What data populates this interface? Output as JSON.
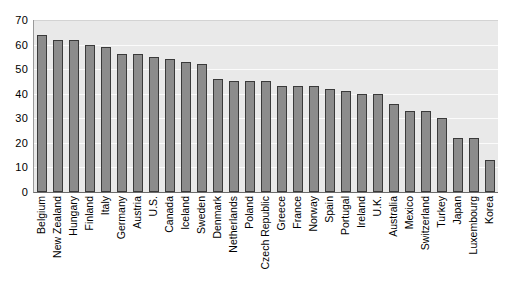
{
  "chart_data": {
    "type": "bar",
    "title": "",
    "subtitle": "",
    "xlabel": "",
    "ylabel": "",
    "ylim": [
      0,
      70
    ],
    "yticks": [
      0,
      10,
      20,
      30,
      40,
      50,
      60,
      70
    ],
    "grid": true,
    "legend": "none",
    "orientation": "vertical",
    "bar_color": "#8c8c8c",
    "bar_edge_color": "#3a3a3a",
    "plot_background": "#e9e9e9",
    "gridline_color": "#fbfbfb",
    "categories": [
      "Belgium",
      "New Zealand",
      "Hungary",
      "Finland",
      "Italy",
      "Germany",
      "Austria",
      "U.S.",
      "Canada",
      "Iceland",
      "Sweden",
      "Denmark",
      "Netherlands",
      "Poland",
      "Czech Republic",
      "Greece",
      "France",
      "Norway",
      "Spain",
      "Portugal",
      "Ireland",
      "U.K.",
      "Australia",
      "Mexico",
      "Switzerland",
      "Turkey",
      "Japan",
      "Luxembourg",
      "Korea"
    ],
    "values": [
      64,
      62,
      62,
      60,
      59,
      56,
      56,
      55,
      54,
      53,
      52,
      46,
      45,
      45,
      45,
      43,
      43,
      43,
      42,
      41,
      40,
      40,
      36,
      33,
      33,
      30,
      22,
      22,
      13
    ]
  }
}
